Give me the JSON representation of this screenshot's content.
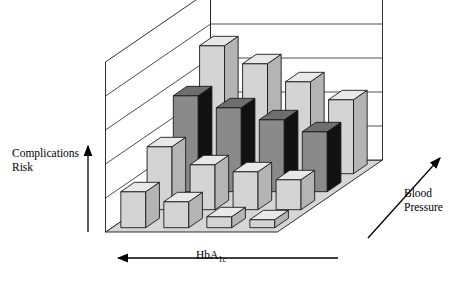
{
  "figure": {
    "background_color": "#ffffff",
    "stroke_color": "#1a1a1a"
  },
  "axes": {
    "y_label": "Complications\nRisk",
    "x_label_main": "HbA",
    "x_label_sub": "1c",
    "z_label": "Blood\nPressure",
    "y_arrow": "up-arrow",
    "x_arrow": "left-arrow",
    "z_arrow": "diagonal-up-right-arrow"
  },
  "palette": {
    "floor": "#d6d6d6",
    "floor_edge": "#1a1a1a",
    "wall": "#ffffff",
    "wall_edge": "#1a1a1a",
    "gridline": "#3a3a3a",
    "light_front": "#d4d4d4",
    "light_side": "#b4b4b4",
    "light_top": "#e8e8e8",
    "mid_front": "#9a9a9a",
    "mid_side": "#7d7d7d",
    "mid_top": "#b2b2b2",
    "dark_front": "#8a8a8a",
    "dark_side": "#111111",
    "dark_top": "#6e6e6e"
  },
  "chart_data": {
    "type": "bar",
    "subtype": "3d-surface-bars",
    "title": "",
    "xlabel": "HbA1c",
    "ylabel": "Complications Risk",
    "zlabel": "Blood Pressure",
    "grid": true,
    "legend": "none",
    "x_categories": [
      "c1",
      "c2",
      "c3",
      "c4"
    ],
    "z_categories": [
      "r1-front",
      "r2",
      "r3",
      "r4-back"
    ],
    "series": [
      {
        "name": "r1-front",
        "shade": "light",
        "values": [
          36,
          26,
          11,
          8
        ]
      },
      {
        "name": "r2",
        "shade": "light",
        "values": [
          63,
          45,
          38,
          30
        ]
      },
      {
        "name": "r3",
        "shade": "dark",
        "values": [
          96,
          84,
          72,
          60
        ]
      },
      {
        "name": "r4-back",
        "shade": "light",
        "values": [
          128,
          110,
          92,
          74
        ]
      }
    ],
    "ylim": [
      0,
      140
    ],
    "wall_gridline_count": 4
  }
}
